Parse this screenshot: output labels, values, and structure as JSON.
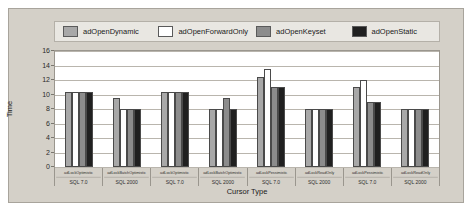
{
  "chart_data": {
    "type": "bar",
    "title": "",
    "xlabel": "Cursor Type",
    "ylabel": "Time",
    "ylim": [
      0,
      16
    ],
    "yticks": [
      "16",
      "14",
      "12",
      "10",
      "8",
      "6",
      "4",
      "2",
      "0"
    ],
    "grid": true,
    "legend_position": "top",
    "categories": [
      "adLockOptimistic",
      "adLockBatchOptimistic",
      "adLockOptimistic",
      "adLockBatchOptimistic",
      "adLockPessimistic",
      "adLockReadOnly",
      "adLockPessimistic",
      "adLockReadOnly"
    ],
    "subcategories": [
      "SQL 7.0",
      "SQL 2000",
      "SQL 7.0",
      "SQL 2000",
      "SQL 7.0",
      "SQL 2000",
      "SQL 7.0",
      "SQL 2000"
    ],
    "series": [
      {
        "name": "adOpenDynamic",
        "color": "#a8a8a8",
        "values": [
          10.3,
          9.5,
          10.3,
          8.0,
          12.4,
          8.0,
          11.0,
          8.0
        ]
      },
      {
        "name": "adOpenForwardOnly",
        "color": "#ffffff",
        "values": [
          10.3,
          8.0,
          10.3,
          8.0,
          13.5,
          8.0,
          12.0,
          8.0
        ]
      },
      {
        "name": "adOpenKeyset",
        "color": "#8c8c8c",
        "values": [
          10.3,
          8.0,
          10.3,
          9.5,
          11.0,
          8.0,
          9.0,
          8.0
        ]
      },
      {
        "name": "adOpenStatic",
        "color": "#202020",
        "values": [
          10.3,
          8.0,
          10.3,
          8.0,
          11.0,
          8.0,
          9.0,
          8.0
        ]
      }
    ]
  }
}
